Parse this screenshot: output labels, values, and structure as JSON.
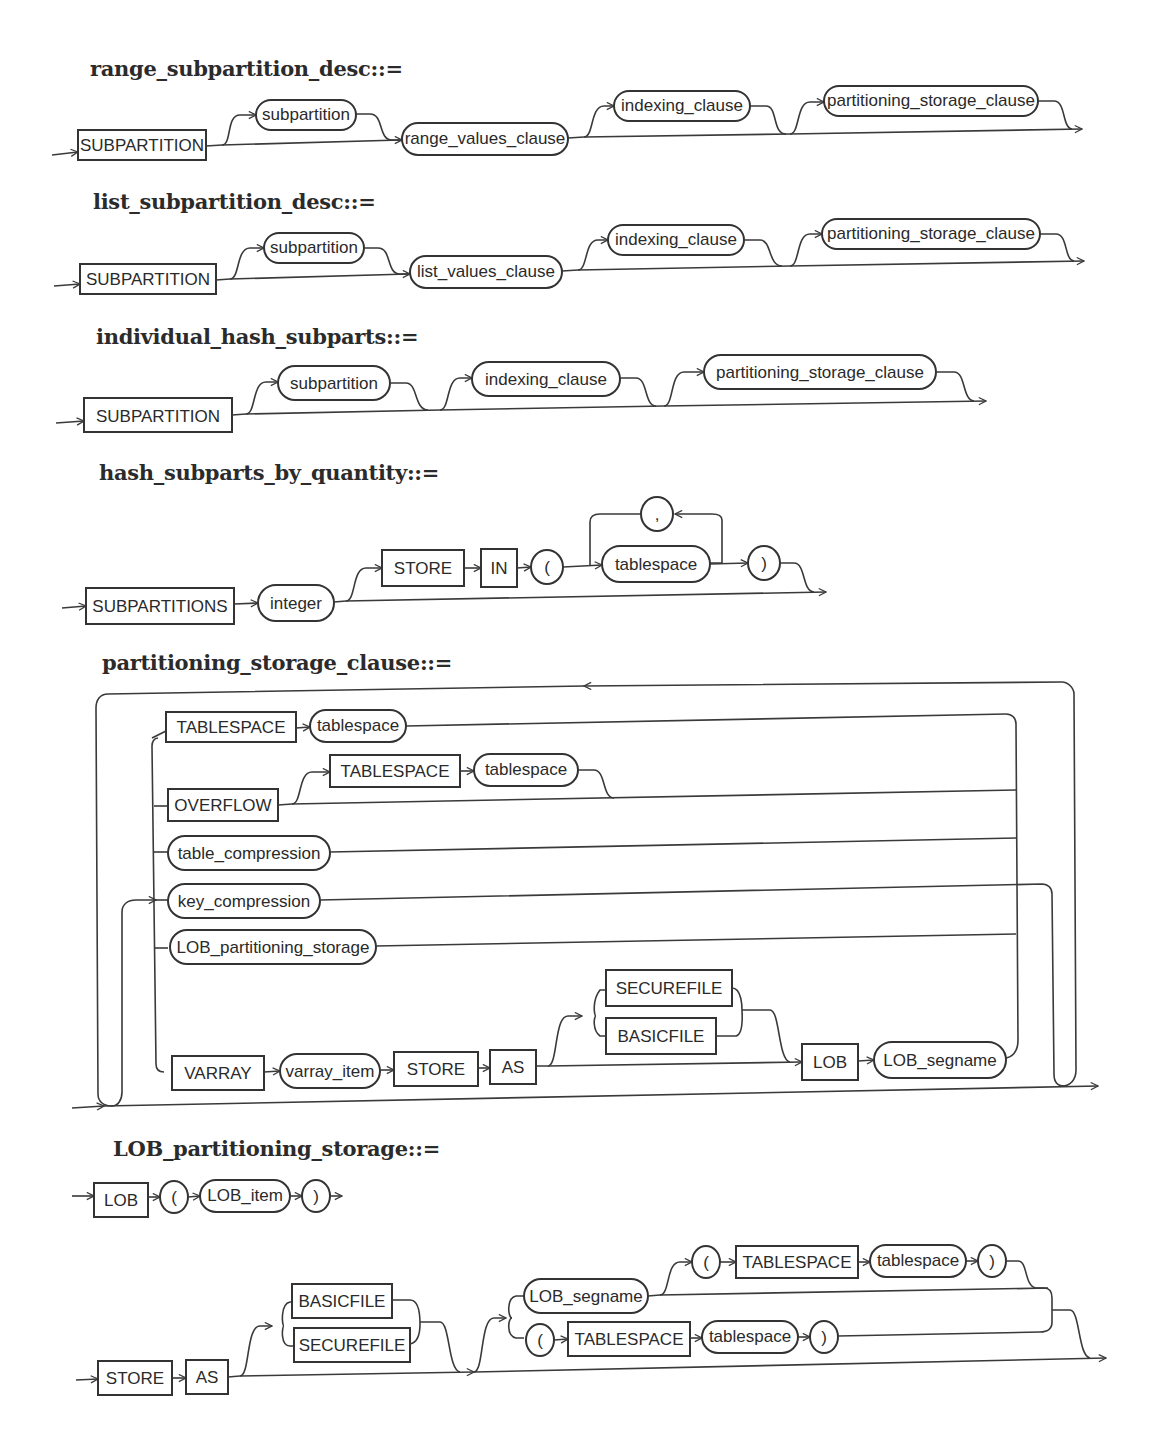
{
  "diagrams": {
    "range_subpartition_desc": {
      "title": "range_subpartition_desc::=",
      "nodes": {
        "subpartition_kw": "SUBPARTITION",
        "subpartition": "subpartition",
        "range_values_clause": "range_values_clause",
        "indexing_clause": "indexing_clause",
        "partitioning_storage_clause": "partitioning_storage_clause"
      }
    },
    "list_subpartition_desc": {
      "title": "list_subpartition_desc::=",
      "nodes": {
        "subpartition_kw": "SUBPARTITION",
        "subpartition": "subpartition",
        "list_values_clause": "list_values_clause",
        "indexing_clause": "indexing_clause",
        "partitioning_storage_clause": "partitioning_storage_clause"
      }
    },
    "individual_hash_subparts": {
      "title": "individual_hash_subparts::=",
      "nodes": {
        "subpartition_kw": "SUBPARTITION",
        "subpartition": "subpartition",
        "indexing_clause": "indexing_clause",
        "partitioning_storage_clause": "partitioning_storage_clause"
      }
    },
    "hash_subparts_by_quantity": {
      "title": "hash_subparts_by_quantity::=",
      "nodes": {
        "subpartitions_kw": "SUBPARTITIONS",
        "integer": "integer",
        "store_kw": "STORE",
        "in_kw": "IN",
        "lparen": "(",
        "comma": ",",
        "tablespace": "tablespace",
        "rparen": ")"
      }
    },
    "partitioning_storage_clause": {
      "title": "partitioning_storage_clause::=",
      "nodes": {
        "tablespace_kw_1": "TABLESPACE",
        "tablespace_1": "tablespace",
        "overflow_kw": "OVERFLOW",
        "tablespace_kw_2": "TABLESPACE",
        "tablespace_2": "tablespace",
        "table_compression": "table_compression",
        "key_compression": "key_compression",
        "lob_partitioning_storage": "LOB_partitioning_storage",
        "varray_kw": "VARRAY",
        "varray_item": "varray_item",
        "store_kw": "STORE",
        "as_kw": "AS",
        "securefile_kw": "SECUREFILE",
        "basicfile_kw": "BASICFILE",
        "lob_kw": "LOB",
        "lob_segname": "LOB_segname"
      }
    },
    "lob_partitioning_storage": {
      "title": "LOB_partitioning_storage::=",
      "nodes": {
        "lob_kw": "LOB",
        "lparen": "(",
        "lob_item": "LOB_item",
        "rparen": ")",
        "store_kw": "STORE",
        "as_kw": "AS",
        "basicfile_kw": "BASICFILE",
        "securefile_kw": "SECUREFILE",
        "lob_segname": "LOB_segname",
        "lparen_2": "(",
        "tablespace_kw_1": "TABLESPACE",
        "tablespace_1": "tablespace",
        "rparen_2": ")",
        "lparen_3": "(",
        "tablespace_kw_2": "TABLESPACE",
        "tablespace_2": "tablespace",
        "rparen_3": ")"
      }
    }
  }
}
